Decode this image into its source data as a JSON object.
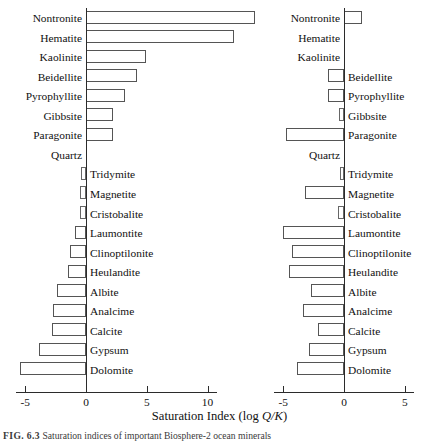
{
  "figure": {
    "caption_figno": "FIG. 6.3",
    "caption_text": "Saturation indices of important Biosphere-2 ocean minerals",
    "xaxis_title_main": "Saturation Index (log ",
    "xaxis_title_italic": "Q/K",
    "xaxis_title_close": ")"
  },
  "chart_data": {
    "type": "bar",
    "title": "Saturation Index (log Q/K)",
    "xlabel": "Saturation Index (log Q/K)",
    "ylabel": "",
    "orientation": "horizontal",
    "grid": false,
    "legend": "none",
    "categories": [
      "Nontronite",
      "Hematite",
      "Kaolinite",
      "Beidellite",
      "Pyrophyllite",
      "Gibbsite",
      "Paragonite",
      "Quartz",
      "Tridymite",
      "Magnetite",
      "Cristobalite",
      "Laumontite",
      "Clinoptilonite",
      "Heulandite",
      "Albite",
      "Analcime",
      "Calcite",
      "Gypsum",
      "Dolomite"
    ],
    "panels": [
      {
        "name": "left-panel",
        "xlim": [
          -7.0,
          10.8
        ],
        "xticks": [
          -5,
          0,
          5,
          10
        ],
        "xticklabels": [
          "-5",
          "0",
          "5",
          "10"
        ],
        "values": [
          13.9,
          12.2,
          4.9,
          4.2,
          3.2,
          2.2,
          2.2,
          0.0,
          -0.4,
          -0.5,
          -0.5,
          -0.9,
          -1.3,
          -1.5,
          -2.4,
          -2.7,
          -2.8,
          -3.9,
          -5.4
        ]
      },
      {
        "name": "right-panel",
        "xlim": [
          -6.2,
          6.4
        ],
        "xticks": [
          -5,
          0,
          5
        ],
        "xticklabels": [
          "-5",
          "0",
          "5"
        ],
        "values": [
          1.5,
          0.0,
          0.0,
          -1.3,
          -1.3,
          -0.4,
          -4.8,
          0.0,
          -0.3,
          -3.2,
          -0.5,
          -5.0,
          -4.3,
          -4.5,
          -2.7,
          -3.4,
          -2.1,
          -2.9,
          -3.9
        ]
      }
    ]
  },
  "labels": {
    "left_panel_inside_left": [
      "Nontronite",
      "Hematite",
      "Kaolinite",
      "Beidellite",
      "Pyrophyllite",
      "Gibbsite",
      "Paragonite",
      "Quartz"
    ],
    "left_panel_inside_right": [
      "Tridymite",
      "Magnetite",
      "Cristobalite",
      "Laumontite",
      "Clinoptilonite",
      "Heulandite",
      "Albite",
      "Analcime",
      "Calcite",
      "Gypsum",
      "Dolomite"
    ],
    "right_panel_inside_left": [
      "Nontronite",
      "Hematite",
      "Kaolinite",
      "Quartz"
    ],
    "right_panel_inside_right": [
      "Beidellite",
      "Pyrophyllite",
      "Gibbsite",
      "Paragonite",
      "Tridymite",
      "Magnetite",
      "Cristobalite",
      "Laumontite",
      "Clinoptilonite",
      "Heulandite",
      "Albite",
      "Analcime",
      "Calcite",
      "Gypsum",
      "Dolomite"
    ]
  },
  "colors": {
    "bar_stroke": "#555555",
    "bar_fill": "#ffffff",
    "axis": "#2b2b2b",
    "text": "#111111",
    "background": "#ffffff"
  }
}
